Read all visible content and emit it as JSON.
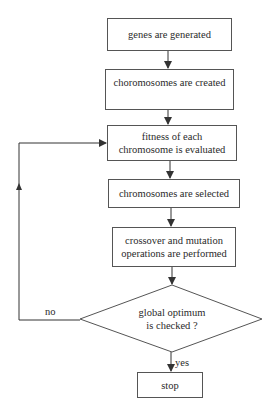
{
  "diagram": {
    "type": "flowchart",
    "nodes": [
      {
        "id": "n1",
        "shape": "rect",
        "lines": [
          "genes are generated"
        ]
      },
      {
        "id": "n2",
        "shape": "rect",
        "lines": [
          "choromosomes are created"
        ]
      },
      {
        "id": "n3",
        "shape": "rect",
        "lines": [
          "fitness of each",
          "chromosome is evaluated"
        ]
      },
      {
        "id": "n4",
        "shape": "rect",
        "lines": [
          "chromosomes are selected"
        ]
      },
      {
        "id": "n5",
        "shape": "rect",
        "lines": [
          "crossover and mutation",
          "operations are performed"
        ]
      },
      {
        "id": "n6",
        "shape": "diamond",
        "lines": [
          "global optimum",
          "is checked ?"
        ]
      },
      {
        "id": "n7",
        "shape": "rect",
        "lines": [
          "stop"
        ]
      }
    ],
    "edges": [
      {
        "from": "n1",
        "to": "n2",
        "label": ""
      },
      {
        "from": "n2",
        "to": "n3",
        "label": ""
      },
      {
        "from": "n3",
        "to": "n4",
        "label": ""
      },
      {
        "from": "n4",
        "to": "n5",
        "label": ""
      },
      {
        "from": "n5",
        "to": "n6",
        "label": ""
      },
      {
        "from": "n6",
        "to": "n7",
        "label": "yes"
      },
      {
        "from": "n6",
        "to": "n3",
        "label": "no"
      }
    ],
    "labels": {
      "yes": "yes",
      "no": "no"
    },
    "colors": {
      "line": "#333333",
      "box_border": "#555555",
      "text": "#2a2a2a",
      "background": "#ffffff"
    }
  }
}
